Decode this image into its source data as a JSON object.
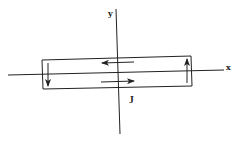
{
  "diagram": {
    "type": "current-loop-in-coordinate-plane",
    "colors": {
      "stroke": "#222222",
      "background": "#ffffff"
    },
    "axes": {
      "x": {
        "label": "x",
        "from": [
          8,
          75
        ],
        "to": [
          224,
          70
        ]
      },
      "y": {
        "label": "y",
        "from": [
          116,
          9
        ],
        "to": [
          120,
          134
        ]
      }
    },
    "loop": {
      "corners": [
        [
          42,
          60
        ],
        [
          191,
          56
        ],
        [
          192,
          86
        ],
        [
          43,
          89
        ]
      ],
      "label": "J"
    },
    "arrows": [
      {
        "name": "top-arrow",
        "direction": "left",
        "from": [
          134,
          62
        ],
        "to": [
          102,
          63
        ]
      },
      {
        "name": "bottom-arrow",
        "direction": "right",
        "from": [
          101,
          82
        ],
        "to": [
          134,
          81
        ]
      },
      {
        "name": "left-arrow",
        "direction": "down",
        "from": [
          48,
          63
        ],
        "to": [
          48,
          86
        ]
      },
      {
        "name": "right-arrow",
        "direction": "up",
        "from": [
          187,
          83
        ],
        "to": [
          187,
          59
        ]
      }
    ]
  }
}
